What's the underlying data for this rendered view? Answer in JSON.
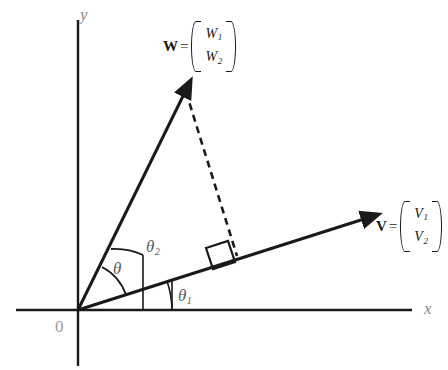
{
  "figure": {
    "type": "vector-angle-diagram",
    "background_color": "#ffffff",
    "stroke_color": "#1a1a1a",
    "label_gray": "#8a8a8a"
  },
  "axes": {
    "x_label": "x",
    "y_label": "y",
    "origin_label": "0"
  },
  "vectors": {
    "w": {
      "name": "W",
      "equals": "=",
      "components": [
        "W",
        "W"
      ],
      "subscripts": [
        "1",
        "2"
      ]
    },
    "v": {
      "name": "V",
      "equals": "=",
      "components": [
        "V",
        "V"
      ],
      "subscripts": [
        "1",
        "2"
      ]
    }
  },
  "angles": {
    "theta": "θ",
    "theta1_symbol": "θ",
    "theta1_sub": "1",
    "theta2_symbol": "θ",
    "theta2_sub": "2"
  },
  "annotations": {
    "right_angle": "right-angle-marker",
    "projection": "dashed-projection-line"
  }
}
